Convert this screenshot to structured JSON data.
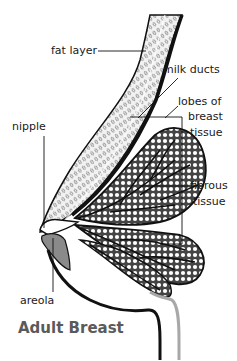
{
  "title": "Adult Breast",
  "labels": {
    "fat_layer": "fat layer",
    "milk_ducts": "milk ducts",
    "lobes_line1": "lobes of",
    "lobes_line2": "breast",
    "lobes_line3": "tissue",
    "nipple": "nipple",
    "fibrous_line1": "fibrous",
    "fibrous_line2": "tissue",
    "areola": "areola"
  },
  "colors": {
    "ink": "#111111",
    "title": "#5a5a5a",
    "shade": "#8a8a8a",
    "light_shade": "#a8a8a8"
  }
}
